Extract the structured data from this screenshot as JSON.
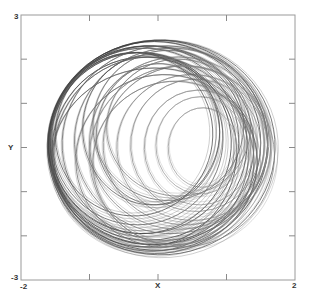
{
  "chart_data": {
    "type": "line",
    "title": "",
    "xlabel": "X",
    "ylabel": "Y",
    "xlim": [
      -2,
      2
    ],
    "ylim": [
      -3,
      3
    ],
    "grid": false,
    "legend": null,
    "x_ticks": [
      -2,
      -1,
      0,
      1,
      2
    ],
    "y_ticks": [
      -3,
      -2,
      -1,
      0,
      1,
      2,
      3
    ],
    "tick_labels": {
      "x_min": "-2",
      "x_max": "2",
      "y_min": "-3",
      "y_max": "3"
    },
    "trajectory_extent": {
      "x": [
        -1.62,
        1.71
      ],
      "y": [
        -2.43,
        2.43
      ]
    },
    "loops": [
      {
        "cx": 0.05,
        "cy": 0.0,
        "rx": 1.66,
        "ry": 2.43,
        "shade": "#555555"
      },
      {
        "cx": 0.0,
        "cy": 0.05,
        "rx": 1.6,
        "ry": 2.38,
        "shade": "#444444"
      },
      {
        "cx": -0.05,
        "cy": 0.1,
        "rx": 1.55,
        "ry": 2.3,
        "shade": "#3a3a3a"
      },
      {
        "cx": -0.1,
        "cy": 0.05,
        "rx": 1.5,
        "ry": 2.25,
        "shade": "#4a4a4a"
      },
      {
        "cx": -0.15,
        "cy": 0.1,
        "rx": 1.45,
        "ry": 2.2,
        "shade": "#404040"
      },
      {
        "cx": -0.2,
        "cy": 0.15,
        "rx": 1.38,
        "ry": 2.1,
        "shade": "#505050"
      },
      {
        "cx": -0.25,
        "cy": 0.1,
        "rx": 1.32,
        "ry": 2.05,
        "shade": "#3f3f3f"
      },
      {
        "cx": -0.3,
        "cy": 0.2,
        "rx": 1.25,
        "ry": 1.95,
        "shade": "#555555"
      },
      {
        "cx": -0.2,
        "cy": -0.1,
        "rx": 1.35,
        "ry": 2.15,
        "shade": "#464646"
      },
      {
        "cx": -0.1,
        "cy": -0.15,
        "rx": 1.42,
        "ry": 2.2,
        "shade": "#5a5a5a"
      },
      {
        "cx": 0.1,
        "cy": 0.1,
        "rx": 1.5,
        "ry": 2.2,
        "shade": "#666666"
      },
      {
        "cx": 0.2,
        "cy": 0.15,
        "rx": 1.42,
        "ry": 2.1,
        "shade": "#707070"
      },
      {
        "cx": 0.3,
        "cy": 0.1,
        "rx": 1.3,
        "ry": 1.95,
        "shade": "#777777"
      },
      {
        "cx": 0.4,
        "cy": 0.05,
        "rx": 1.2,
        "ry": 1.8,
        "shade": "#808080"
      },
      {
        "cx": 0.5,
        "cy": 0.0,
        "rx": 1.1,
        "ry": 1.65,
        "shade": "#888888"
      },
      {
        "cx": 0.55,
        "cy": 0.05,
        "rx": 0.95,
        "ry": 1.5,
        "shade": "#8a8a8a"
      },
      {
        "cx": 0.6,
        "cy": 0.0,
        "rx": 0.8,
        "ry": 1.3,
        "shade": "#909090"
      },
      {
        "cx": 0.62,
        "cy": 0.05,
        "rx": 0.65,
        "ry": 1.1,
        "shade": "#999999"
      },
      {
        "cx": 0.65,
        "cy": 0.0,
        "rx": 0.5,
        "ry": 0.9,
        "shade": "#9a9a9a"
      },
      {
        "cx": 0.0,
        "cy": 0.3,
        "rx": 0.9,
        "ry": 1.6,
        "shade": "#6a6a6a"
      },
      {
        "cx": -0.1,
        "cy": 0.4,
        "rx": 1.0,
        "ry": 1.7,
        "shade": "#5c5c5c"
      },
      {
        "cx": 0.15,
        "cy": 0.5,
        "rx": 1.1,
        "ry": 1.7,
        "shade": "#6e6e6e"
      },
      {
        "cx": 0.3,
        "cy": 0.45,
        "rx": 1.05,
        "ry": 1.55,
        "shade": "#7a7a7a"
      },
      {
        "cx": -0.35,
        "cy": 0.3,
        "rx": 1.15,
        "ry": 1.85,
        "shade": "#4e4e4e"
      },
      {
        "cx": 0.1,
        "cy": -0.3,
        "rx": 1.3,
        "ry": 1.95,
        "shade": "#6c6c6c"
      },
      {
        "cx": 0.25,
        "cy": -0.35,
        "rx": 1.2,
        "ry": 1.85,
        "shade": "#7c7c7c"
      },
      {
        "cx": 0.35,
        "cy": -0.2,
        "rx": 1.35,
        "ry": 2.05,
        "shade": "#858585"
      },
      {
        "cx": -0.05,
        "cy": -0.3,
        "rx": 1.5,
        "ry": 2.1,
        "shade": "#5e5e5e"
      }
    ]
  },
  "labels": {
    "y_max": "3",
    "y_min": "-3",
    "x_min": "-2",
    "x_max": "2",
    "x_axis": "X",
    "y_axis": "Y"
  }
}
